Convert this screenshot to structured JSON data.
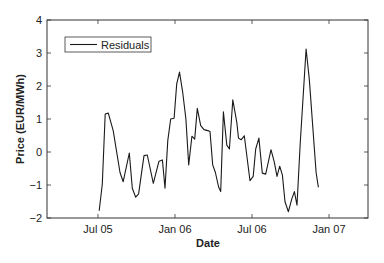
{
  "chart_data": {
    "type": "line",
    "title": "",
    "xlabel": "Date",
    "ylabel": "Price (EUR/MWh)",
    "xlim": [
      2005.169,
      2007.253
    ],
    "ylim": [
      -2,
      4
    ],
    "grid": false,
    "legend_position": "upper left",
    "x_ticks": [
      {
        "value": 2005.5,
        "label": "Jul 05"
      },
      {
        "value": 2006.0,
        "label": "Jan 06"
      },
      {
        "value": 2006.5,
        "label": "Jul 06"
      },
      {
        "value": 2007.0,
        "label": "Jan 07"
      }
    ],
    "y_ticks": [
      -2,
      -1,
      0,
      1,
      2,
      3,
      4
    ],
    "series": [
      {
        "name": "Residuals",
        "color": "#1a1a1a",
        "x": [
          2005.508,
          2005.528,
          2005.547,
          2005.567,
          2005.599,
          2005.643,
          2005.664,
          2005.703,
          2005.723,
          2005.745,
          2005.764,
          2005.799,
          2005.82,
          2005.859,
          2005.896,
          2005.918,
          2005.935,
          2005.953,
          2005.972,
          2005.994,
          2006.011,
          2006.029,
          2006.05,
          2006.071,
          2006.089,
          2006.11,
          2006.128,
          2006.145,
          2006.167,
          2006.188,
          2006.219,
          2006.227,
          2006.245,
          2006.262,
          2006.284,
          2006.297,
          2006.314,
          2006.336,
          2006.353,
          2006.375,
          2006.401,
          2006.412,
          2006.429,
          2006.45,
          2006.487,
          2006.508,
          2006.524,
          2006.545,
          2006.567,
          2006.589,
          2006.623,
          2006.645,
          2006.662,
          2006.68,
          2006.697,
          2006.714,
          2006.736,
          2006.758,
          2006.775,
          2006.792,
          2006.813,
          2006.851,
          2006.872,
          2006.916,
          2006.931
        ],
        "values": [
          -1.78,
          -0.97,
          1.15,
          1.18,
          0.65,
          -0.62,
          -0.9,
          -0.03,
          -1.1,
          -1.37,
          -1.27,
          -0.11,
          -0.09,
          -0.95,
          -0.28,
          -0.24,
          -1.1,
          0.35,
          1.0,
          1.02,
          2.06,
          2.42,
          1.81,
          1.0,
          -0.39,
          0.48,
          0.39,
          1.32,
          0.8,
          0.68,
          0.64,
          0.62,
          -0.39,
          -0.62,
          -1.07,
          -1.2,
          1.22,
          0.21,
          0.09,
          1.58,
          0.9,
          0.42,
          0.37,
          0.49,
          -0.87,
          -0.74,
          0.09,
          0.42,
          -0.64,
          -0.67,
          0.07,
          -0.31,
          -0.74,
          -0.43,
          -0.7,
          -1.51,
          -1.81,
          -1.42,
          -1.2,
          -1.61,
          0.25,
          3.12,
          2.21,
          -0.62,
          -1.07
        ]
      }
    ]
  },
  "legend": {
    "label": "Residuals"
  },
  "axes": {
    "xlabel": "Date",
    "ylabel": "Price (EUR/MWh)"
  }
}
